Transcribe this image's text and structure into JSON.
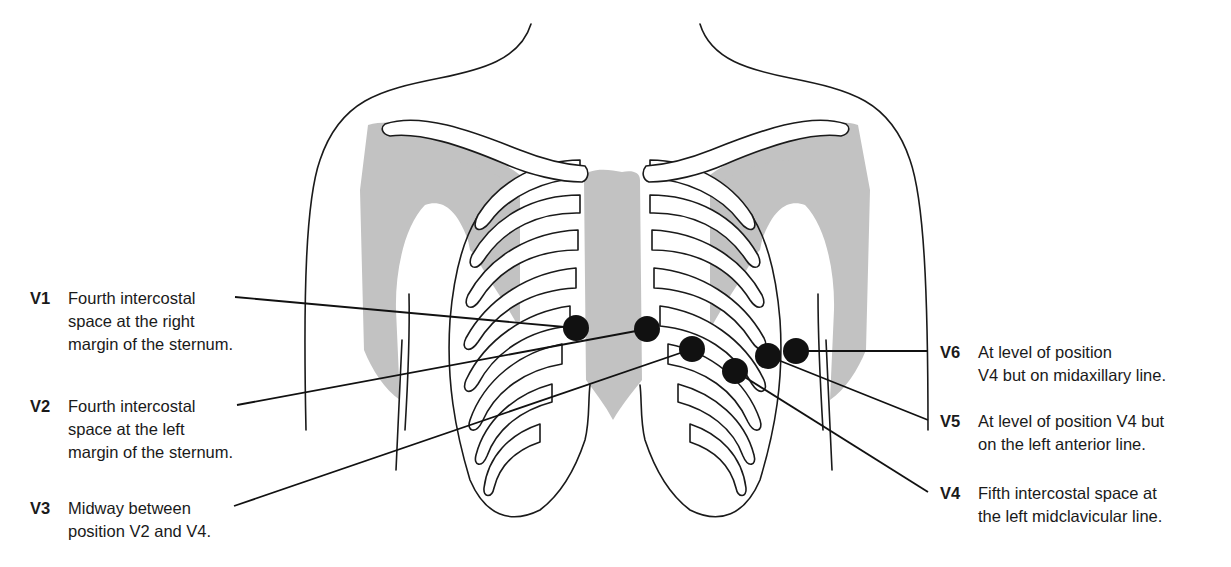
{
  "diagram": {
    "colors": {
      "line": "#1a1a1a",
      "bone_shade": "#c2c2c2",
      "electrode": "#111111",
      "background": "#ffffff"
    },
    "electrodes": [
      {
        "id": "V1",
        "cx": 576,
        "cy": 328,
        "label_lines": [
          "Fourth intercostal",
          "space at the right",
          "margin of the sternum."
        ],
        "side": "left"
      },
      {
        "id": "V2",
        "cx": 647,
        "cy": 329,
        "label_lines": [
          "Fourth intercostal",
          "space at the left",
          "margin of the sternum."
        ],
        "side": "left"
      },
      {
        "id": "V3",
        "cx": 692,
        "cy": 349,
        "label_lines": [
          "Midway between",
          "position V2 and V4."
        ],
        "side": "left"
      },
      {
        "id": "V4",
        "cx": 735,
        "cy": 371,
        "label_lines": [
          "Fifth intercostal space at",
          "the left midclavicular line."
        ],
        "side": "right"
      },
      {
        "id": "V5",
        "cx": 768,
        "cy": 356,
        "label_lines": [
          "At level of position V4 but",
          "on the left anterior line."
        ],
        "side": "right"
      },
      {
        "id": "V6",
        "cx": 796,
        "cy": 351,
        "label_lines": [
          "At level of position",
          "V4 but on midaxillary line."
        ],
        "side": "right"
      }
    ]
  }
}
